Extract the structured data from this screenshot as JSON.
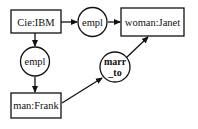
{
  "diagram": {
    "type": "conceptual-graph",
    "concepts": [
      {
        "id": "ibm",
        "label": "Cie:IBM"
      },
      {
        "id": "janet",
        "label": "woman:Janet"
      },
      {
        "id": "frank",
        "label": "man:Frank"
      }
    ],
    "relations": [
      {
        "id": "empl1",
        "label": "empl",
        "from": "ibm",
        "to": "janet"
      },
      {
        "id": "empl2",
        "label": "empl",
        "from": "ibm",
        "to": "frank"
      },
      {
        "id": "marr",
        "label_line1": "marr",
        "label_line2": "_to",
        "from": "frank",
        "to": "janet"
      }
    ]
  }
}
